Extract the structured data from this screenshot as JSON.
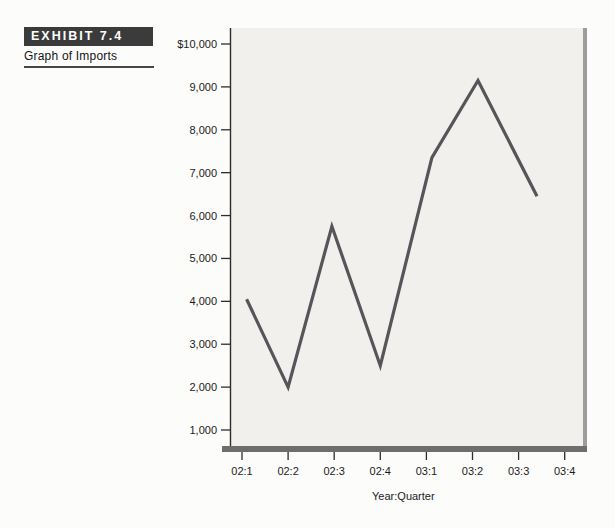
{
  "exhibit": {
    "tag": "EXHIBIT 7.4",
    "title": "Graph of Imports"
  },
  "chart_data": {
    "type": "line",
    "title": "",
    "xlabel": "Year:Quarter",
    "ylabel": "",
    "categories": [
      "02:1",
      "02:2",
      "02:3",
      "02:4",
      "03:1",
      "03:2",
      "03:3",
      "03:4"
    ],
    "series": [
      {
        "name": "Imports",
        "points": [
          {
            "x": "02:1",
            "y": 4050
          },
          {
            "x": "02:2",
            "y": 2000
          },
          {
            "x": "02:3",
            "y": 5750
          },
          {
            "x": "02:4",
            "y": 2500
          },
          {
            "x": "03:1",
            "y": 7350
          },
          {
            "x": "03:2",
            "y": 9150
          },
          {
            "x": "03:3",
            "y": 6450
          }
        ]
      }
    ],
    "y_ticks": [
      {
        "value": 10000,
        "label": "$10,000"
      },
      {
        "value": 9000,
        "label": "9,000"
      },
      {
        "value": 8000,
        "label": "8,000"
      },
      {
        "value": 7000,
        "label": "7,000"
      },
      {
        "value": 6000,
        "label": "6,000"
      },
      {
        "value": 5000,
        "label": "5,000"
      },
      {
        "value": 4000,
        "label": "4,000"
      },
      {
        "value": 3000,
        "label": "3,000"
      },
      {
        "value": 2000,
        "label": "2,000"
      },
      {
        "value": 1000,
        "label": "1,000"
      }
    ],
    "ylim": [
      600,
      10400
    ],
    "grid": false,
    "legend": "none",
    "layout_hints": {
      "x_positions": [
        0.1,
        1,
        1.95,
        3.0,
        4.12,
        5.12,
        6.4
      ]
    },
    "colors": {
      "line": "#56565a",
      "plot_background": "#f1f0ec",
      "axis": "#2d2d2d",
      "frame_bottom": "#6e6e6e",
      "frame_right": "#9c9c9c",
      "text": "#1b1b1b"
    }
  }
}
